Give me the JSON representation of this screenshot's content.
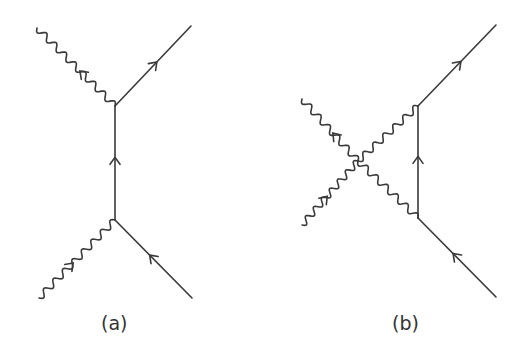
{
  "figure": {
    "panels": [
      {
        "id": "a",
        "label": "(a)",
        "description": "s-channel-like Compton scattering tree diagram: photon in, fermion propagator, photon out",
        "vertices": [
          [
            115,
            106
          ],
          [
            115,
            220
          ]
        ],
        "fermion_lines": [
          {
            "from": [
              115,
              220
            ],
            "to": [
              115,
              106
            ],
            "arrow": "up"
          },
          {
            "from": [
              192,
              298
            ],
            "to": [
              115,
              220
            ],
            "arrow": "incoming"
          },
          {
            "from": [
              115,
              106
            ],
            "to": [
              191,
              26
            ],
            "arrow": "outgoing"
          }
        ],
        "photon_lines": [
          {
            "from": [
              39,
              298
            ],
            "to": [
              115,
              220
            ]
          },
          {
            "from": [
              115,
              106
            ],
            "to": [
              37,
              28
            ]
          }
        ]
      },
      {
        "id": "b",
        "label": "(b)",
        "description": "Diagram with four-photon contact point connected to fermion line via two photons",
        "vertices": [
          [
            418,
            106
          ],
          [
            418,
            218
          ],
          [
            358,
            161
          ]
        ],
        "fermion_lines": [
          {
            "from": [
              418,
              218
            ],
            "to": [
              418,
              106
            ],
            "arrow": "up"
          },
          {
            "from": [
              496,
              297
            ],
            "to": [
              418,
              218
            ],
            "arrow": "incoming"
          },
          {
            "from": [
              418,
              106
            ],
            "to": [
              496,
              25
            ],
            "arrow": "outgoing"
          }
        ],
        "photon_lines": [
          {
            "from": [
              302,
              225
            ],
            "to": [
              358,
              161
            ]
          },
          {
            "from": [
              358,
              161
            ],
            "to": [
              302,
              99
            ]
          },
          {
            "from": [
              358,
              161
            ],
            "to": [
              418,
              106
            ]
          },
          {
            "from": [
              358,
              161
            ],
            "to": [
              418,
              218
            ]
          }
        ]
      }
    ]
  }
}
